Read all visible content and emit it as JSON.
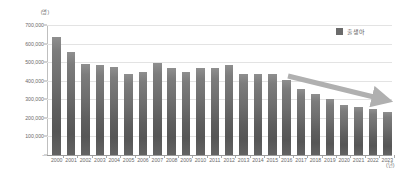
{
  "chart_data": {
    "type": "bar",
    "title": "",
    "xlabel": "(년)",
    "ylabel": "(명)",
    "categories": [
      "2000",
      "2001",
      "2002",
      "2003",
      "2004",
      "2005",
      "2006",
      "2007",
      "2008",
      "2009",
      "2010",
      "2011",
      "2012",
      "2013",
      "2014",
      "2015",
      "2016",
      "2017",
      "2018",
      "2019",
      "2020",
      "2021",
      "2022",
      "2023"
    ],
    "series": [
      {
        "name": "출생아",
        "values": [
          635000,
          555000,
          492000,
          485000,
          473000,
          435000,
          448000,
          493000,
          466000,
          445000,
          470000,
          471000,
          484000,
          436000,
          435000,
          438000,
          406000,
          357000,
          327000,
          303000,
          272000,
          261000,
          249000,
          230000
        ]
      }
    ],
    "ylim": [
      0,
      700000
    ],
    "yticks": [
      "-",
      "100,000",
      "200,000",
      "300,000",
      "400,000",
      "500,000",
      "600,000",
      "700,000"
    ],
    "ytick_values": [
      0,
      100000,
      200000,
      300000,
      400000,
      500000,
      600000,
      700000
    ],
    "grid": true,
    "legend_position": "top-right",
    "annotations": [
      {
        "name": "declining-trend-arrow",
        "type": "arrow",
        "from_category": "2017",
        "to_category": "2023",
        "direction": "down-right",
        "color": "#b0b0b0"
      }
    ]
  },
  "legend": {
    "entries": [
      {
        "label": "출생아",
        "color": "#6b6b6b"
      }
    ]
  },
  "axes": {
    "y_unit": "(명)",
    "x_unit": "(년)"
  },
  "colors": {
    "bar_top": "#8f8f8f",
    "bar_bottom": "#565656",
    "grid": "#e3e3e3",
    "axis": "#9a9a9a",
    "text": "#6b6b6b",
    "arrow": "#b0b0b0",
    "background": "#ffffff"
  }
}
